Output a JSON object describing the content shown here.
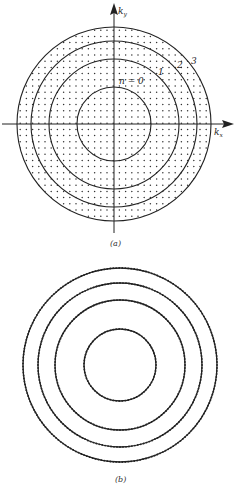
{
  "figure_a": {
    "caption": "(a)",
    "axis_x_label": "k",
    "axis_x_sub": "x",
    "axis_y_label": "k",
    "axis_y_sub": "y",
    "ring_labels": [
      "n = 0",
      "1",
      "2",
      "3"
    ],
    "rings": [
      0,
      1,
      2,
      3
    ],
    "fill": "dotted lattice of allowed k-points"
  },
  "figure_b": {
    "caption": "(b)",
    "rings": [
      0,
      1,
      2,
      3
    ],
    "fill": "points concentrated on ring circumferences"
  },
  "colors": {
    "line": "#222222",
    "dot": "#333333",
    "background": "#ffffff"
  }
}
